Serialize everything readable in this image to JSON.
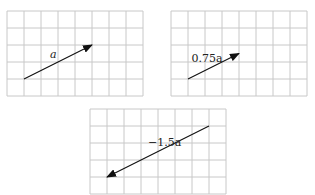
{
  "diagram": {
    "type": "vector-scaling-on-grids",
    "unit": "grid cell",
    "grid_cols": 8,
    "grid_rows": 5,
    "base_vector": {
      "name": "a",
      "components": [
        4,
        2
      ]
    },
    "panels": [
      {
        "id": "panel-a",
        "label": "a",
        "scalar": 1,
        "start": [
          1,
          1
        ],
        "vector": [
          4,
          2
        ]
      },
      {
        "id": "panel-075a",
        "label": "0.75a",
        "scalar": 0.75,
        "start": [
          1,
          1
        ],
        "vector": [
          3,
          1.5
        ]
      },
      {
        "id": "panel-neg15a",
        "label": "−1.5a",
        "scalar": -1.5,
        "start": [
          7,
          4
        ],
        "vector": [
          -6,
          -3
        ]
      }
    ]
  }
}
